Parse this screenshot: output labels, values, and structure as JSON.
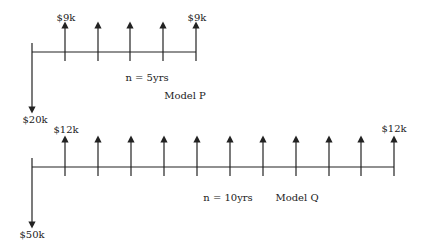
{
  "diagrams": [
    {
      "name": "Model P",
      "model_label": "Model P",
      "period_label": "n = 5yrs",
      "initial_outflow": "$20k",
      "first_inflow_label": "$9k",
      "last_inflow_label": "$9k",
      "years": 5,
      "inflow_per_year": "$9k"
    },
    {
      "name": "Model Q",
      "model_label": "Model Q",
      "period_label": "n = 10yrs",
      "initial_outflow": "$50k",
      "first_inflow_label": "$12k",
      "last_inflow_label": "$12k",
      "years": 10,
      "inflow_per_year": "$12k"
    }
  ],
  "colors": {
    "line": "#222222",
    "background": "#ffffff"
  }
}
